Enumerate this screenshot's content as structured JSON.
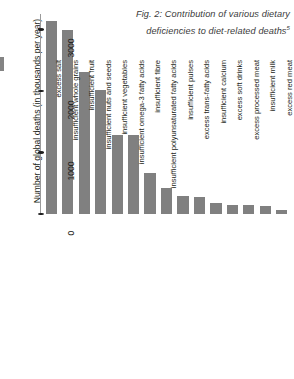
{
  "caption": {
    "text": "Fig. 2: Contribution of various dietary deficiencies to diet-related deaths",
    "footnote_marker": "5"
  },
  "chart_data": {
    "type": "bar",
    "title": "Fig. 2: Contribution of various dietary deficiencies to diet-related deaths",
    "xlabel": "",
    "ylabel": "Number of global deaths (in thousands per year)",
    "ylim": [
      0,
      3250
    ],
    "yticks": [
      0,
      1000,
      2000,
      3000
    ],
    "ytick_labels": [
      "0",
      "1000",
      "2000",
      "3000"
    ],
    "grid": false,
    "legend": false,
    "bar_color": "#808080",
    "categories": [
      "excess salt",
      "insufficient whole grains",
      "insufficient fruit",
      "insufficient nuts and seeds",
      "insufficient vegetables",
      "insufficient omega-3 fatty acids",
      "insufficient fibre",
      "insufficient polyunsaturated fatty acids",
      "insufficient pulses",
      "excess trans-fatty acids",
      "insufficient calcium",
      "excess soft drinks",
      "excess processed meat",
      "insufficient milk",
      "excess red meat"
    ],
    "values": [
      3130,
      2990,
      2310,
      2010,
      1290,
      1290,
      660,
      420,
      300,
      270,
      180,
      150,
      140,
      130,
      60
    ]
  }
}
